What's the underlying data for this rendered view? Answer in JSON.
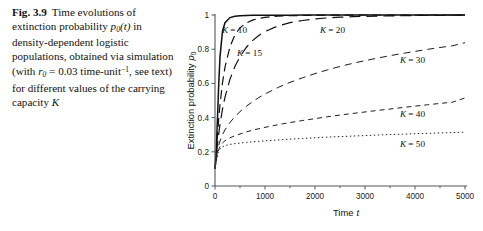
{
  "caption": {
    "fig_label": "Fig. 3.9",
    "line1": "Time evolutions of",
    "line2_a": "extinction probability",
    "line2_var": "p",
    "line2_sub": "0",
    "line2_b": "(t)",
    "line3": "in density-dependent logistic",
    "line4": "populations, obtained via",
    "line5_a": "simulation (with",
    "line5_var": "r",
    "line5_sub": "0",
    "line5_b": "= 0.03",
    "line6_a": "time-unit",
    "line6_sup": "−1",
    "line6_b": ", see text) for",
    "line7": "different values of the",
    "line8_a": "carrying capacity",
    "line8_var": "K"
  },
  "chart_data": {
    "type": "line",
    "title": "",
    "xlabel": "Time t",
    "ylabel": "Extinction probability p0",
    "xlabel_main": "Time",
    "xlabel_var": "t",
    "ylabel_main": "Extinction probability",
    "ylabel_var": "p",
    "ylabel_sub": "0",
    "xlim": [
      0,
      5000
    ],
    "ylim": [
      0,
      1
    ],
    "xticks": [
      0,
      1000,
      2000,
      3000,
      4000,
      5000
    ],
    "xticklabels": [
      "0",
      "1000",
      "2000",
      "3000",
      "4000",
      "5000"
    ],
    "yticks": [
      0,
      0.2,
      0.4,
      0.6,
      0.8,
      1
    ],
    "yticklabels": [
      "0",
      "0.2",
      "0.4",
      "0.6",
      "0.8",
      "1"
    ],
    "minor_xticks": [
      500,
      1500,
      2500,
      3500,
      4500
    ],
    "grid": false,
    "legend_position": "inline-annotations",
    "x": [
      0,
      25,
      50,
      75,
      100,
      150,
      200,
      300,
      400,
      500,
      625,
      750,
      875,
      1000,
      1250,
      1500,
      1750,
      2000,
      2250,
      2500,
      2750,
      3000,
      3250,
      3500,
      3750,
      4000,
      4250,
      4500,
      4750,
      5000
    ],
    "series": [
      {
        "name": "K = 10",
        "label": "K = 10",
        "label_var": "K",
        "label_rest": "= 10",
        "dash": "none",
        "width": 1.5,
        "color": "#111111",
        "label_x": 222,
        "label_y": 33,
        "values": [
          0.1,
          0.215,
          0.4,
          0.6,
          0.755,
          0.905,
          0.955,
          0.985,
          0.993,
          0.996,
          0.997,
          0.998,
          0.998,
          0.999,
          0.999,
          0.999,
          1.0,
          1.0,
          1.0,
          1.0,
          1.0,
          1.0,
          1.0,
          1.0,
          1.0,
          1.0,
          1.0,
          1.0,
          1.0,
          1.0
        ]
      },
      {
        "name": "K = 15",
        "label": "K = 15",
        "label_var": "K",
        "label_rest": "= 15",
        "dash": "9,5",
        "width": 1.2,
        "color": "#111111",
        "label_x": 237,
        "label_y": 56,
        "values": [
          0.1,
          0.195,
          0.3,
          0.395,
          0.475,
          0.605,
          0.695,
          0.815,
          0.885,
          0.925,
          0.953,
          0.97,
          0.98,
          0.986,
          0.993,
          0.996,
          0.997,
          0.998,
          0.999,
          0.999,
          0.999,
          1.0,
          1.0,
          1.0,
          1.0,
          1.0,
          1.0,
          1.0,
          1.0,
          1.0
        ]
      },
      {
        "name": "K = 20",
        "label": "K = 20",
        "label_var": "K",
        "label_rest": "= 20",
        "dash": "11,6",
        "width": 1.2,
        "color": "#111111",
        "label_x": 320,
        "label_y": 33,
        "values": [
          0.1,
          0.175,
          0.245,
          0.305,
          0.36,
          0.45,
          0.52,
          0.625,
          0.7,
          0.757,
          0.81,
          0.85,
          0.88,
          0.903,
          0.935,
          0.955,
          0.968,
          0.977,
          0.983,
          0.987,
          0.99,
          0.992,
          0.994,
          0.995,
          0.996,
          0.997,
          0.998,
          0.998,
          0.999,
          0.999
        ]
      },
      {
        "name": "K = 30",
        "label": "K = 30",
        "label_var": "K",
        "label_rest": "= 30",
        "dash": "7,5",
        "width": 0.95,
        "color": "#2b2b2b",
        "label_x": 400,
        "label_y": 63,
        "values": [
          0.1,
          0.16,
          0.205,
          0.238,
          0.263,
          0.3,
          0.328,
          0.372,
          0.406,
          0.435,
          0.466,
          0.493,
          0.517,
          0.538,
          0.575,
          0.606,
          0.633,
          0.657,
          0.679,
          0.699,
          0.717,
          0.733,
          0.748,
          0.762,
          0.775,
          0.787,
          0.799,
          0.81,
          0.82,
          0.838
        ]
      },
      {
        "name": "K = 40",
        "label": "K = 40",
        "label_var": "K",
        "label_rest": "= 40",
        "dash": "5,4",
        "width": 0.95,
        "color": "#2b2b2b",
        "label_x": 400,
        "label_y": 117,
        "values": [
          0.1,
          0.152,
          0.19,
          0.214,
          0.231,
          0.252,
          0.265,
          0.282,
          0.294,
          0.304,
          0.316,
          0.326,
          0.335,
          0.343,
          0.358,
          0.371,
          0.383,
          0.394,
          0.405,
          0.415,
          0.424,
          0.433,
          0.442,
          0.45,
          0.459,
          0.467,
          0.475,
          0.483,
          0.49,
          0.515
        ]
      },
      {
        "name": "K = 50",
        "label": "K = 50",
        "label_var": "K",
        "label_rest": "= 50",
        "dash": "1.5,2.5",
        "width": 0.9,
        "color": "#4a4a4a",
        "label_x": 400,
        "label_y": 147,
        "values": [
          0.1,
          0.148,
          0.183,
          0.203,
          0.216,
          0.229,
          0.236,
          0.243,
          0.248,
          0.251,
          0.255,
          0.258,
          0.261,
          0.264,
          0.269,
          0.274,
          0.278,
          0.282,
          0.286,
          0.289,
          0.292,
          0.295,
          0.298,
          0.301,
          0.303,
          0.306,
          0.308,
          0.31,
          0.312,
          0.315
        ]
      }
    ]
  }
}
